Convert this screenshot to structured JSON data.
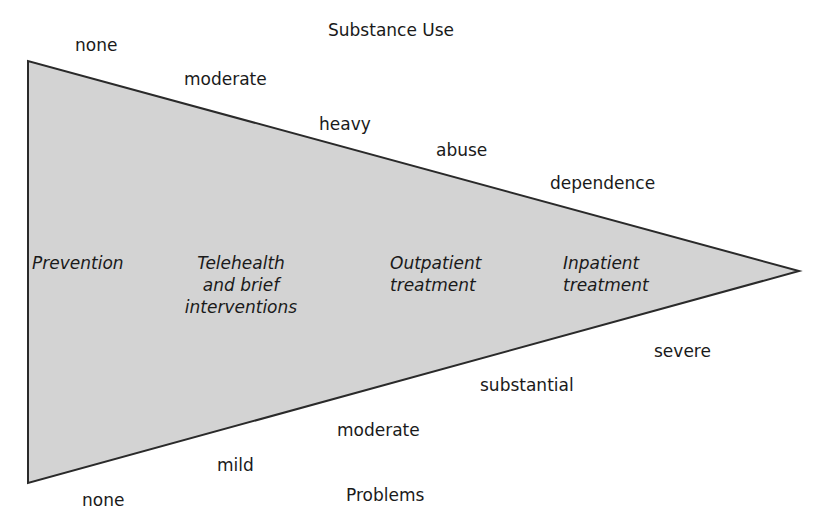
{
  "diagram": {
    "top_axis_title": "Substance Use",
    "bottom_axis_title": "Problems",
    "substance_use_levels": [
      "none",
      "moderate",
      "heavy",
      "abuse",
      "dependence"
    ],
    "problem_levels": [
      "none",
      "mild",
      "moderate",
      "substantial",
      "severe"
    ],
    "treatment_zones": [
      {
        "line1": "Prevention",
        "line2": "",
        "line3": ""
      },
      {
        "line1": "Telehealth",
        "line2": "and brief",
        "line3": "interventions"
      },
      {
        "line1": "Outpatient",
        "line2": "treatment",
        "line3": ""
      },
      {
        "line1": "Inpatient",
        "line2": "treatment",
        "line3": ""
      }
    ],
    "colors": {
      "fill": "#d3d3d3",
      "stroke": "#2a2a2a",
      "text": "#1a1a1a"
    }
  }
}
